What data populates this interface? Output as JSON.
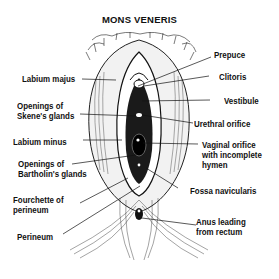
{
  "title": "MONS VENERIS",
  "labels": {
    "labium_majus": "Labium majus",
    "openings_skene": "Openings of\nSkene's glands",
    "labium_minus": "Labium minus",
    "openings_bartholin": "Openings of\nBartholin's glands",
    "fourchette": "Fourchette of\nperineum",
    "perineum": "Perineum",
    "prepuce": "Prepuce",
    "clitoris": "Clitoris",
    "vestibule": "Vestibule",
    "urethral_orifice": "Urethral orifice",
    "vaginal_orifice": "Vaginal orifice\nwith incomplete\nhymen",
    "fossa_navicularis": "Fossa navicularis",
    "anus": "Anus leading\nfrom rectum"
  },
  "colors": {
    "ink": "#111111",
    "background": "#ffffff"
  }
}
